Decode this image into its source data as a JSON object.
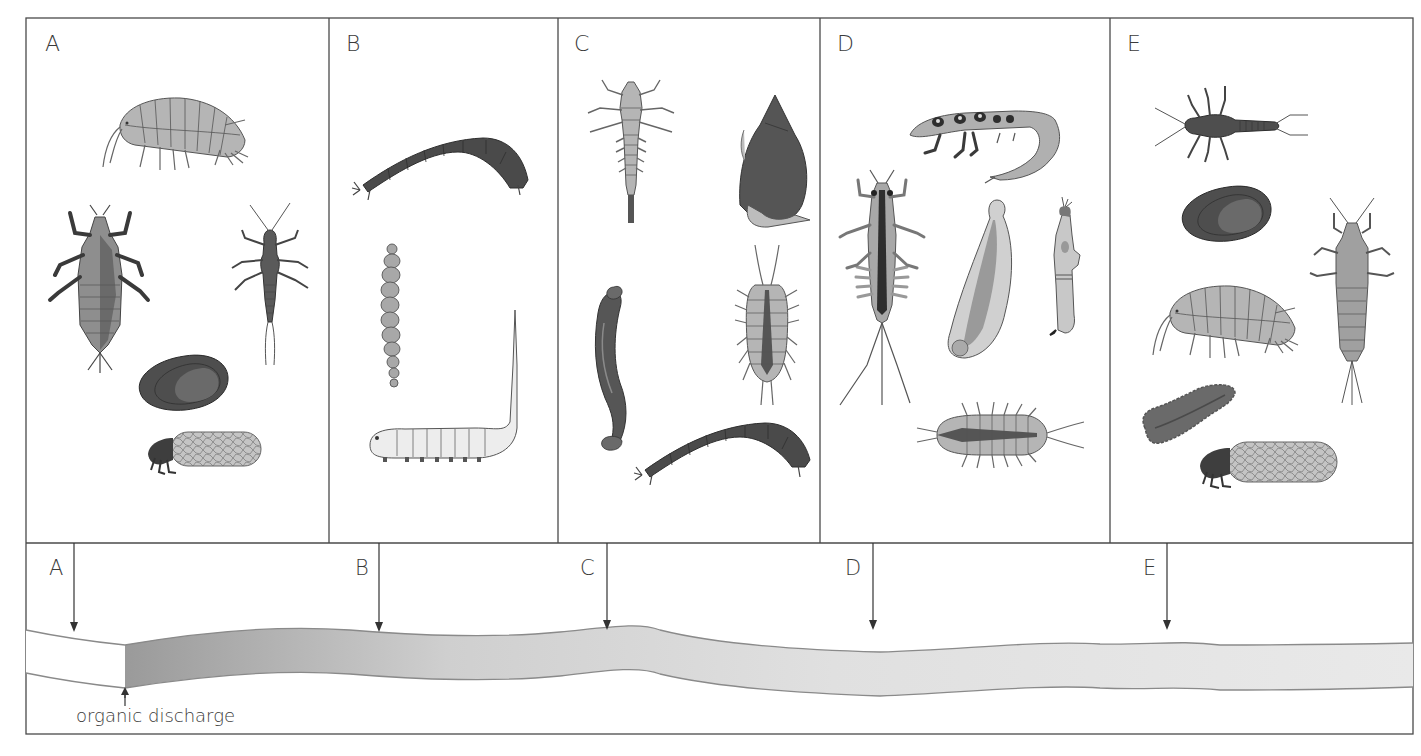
{
  "figure": {
    "panels": [
      {
        "id": "A",
        "label": "A",
        "organisms": [
          "freshwater shrimp (amphipod)",
          "dragonfly/damselfly nymph",
          "stonefly nymph",
          "freshwater mussel",
          "cased caddisfly larva"
        ]
      },
      {
        "id": "B",
        "label": "B",
        "organisms": [
          "midge larva (dark)",
          "bloodworm / tubifex",
          "rat-tailed maggot"
        ]
      },
      {
        "id": "C",
        "label": "C",
        "organisms": [
          "alderfly/beetle larva",
          "pond snail",
          "leech",
          "water louse (isopod)",
          "midge larva"
        ]
      },
      {
        "id": "D",
        "label": "D",
        "organisms": [
          "caddis larva (free-living)",
          "mayfly nymph",
          "flatworm",
          "blackfly larva",
          "water louse (isopod)"
        ]
      },
      {
        "id": "E",
        "label": "E",
        "organisms": [
          "stonefly nymph",
          "freshwater mussel",
          "mayfly nymph",
          "freshwater shrimp (amphipod)",
          "flatworm",
          "cased caddisfly larva"
        ]
      }
    ],
    "river": {
      "sample_points": [
        {
          "label": "A",
          "x": 74
        },
        {
          "label": "B",
          "x": 379
        },
        {
          "label": "C",
          "x": 607
        },
        {
          "label": "D",
          "x": 873
        },
        {
          "label": "E",
          "x": 1167
        }
      ],
      "discharge_label": "organic discharge",
      "colors": {
        "clean_water": "#ffffff",
        "polluted_start": "#9a9a9a",
        "polluted_end": "#e6e6e6",
        "bank_line": "#8a8a8a"
      }
    },
    "colors": {
      "border": "#4a4a4a",
      "text": "#3a3a3a",
      "light_organism": "#b5b5b5",
      "mid_organism": "#8e8e8e",
      "dark_organism": "#4e4e4e",
      "outline": "#555555"
    }
  }
}
